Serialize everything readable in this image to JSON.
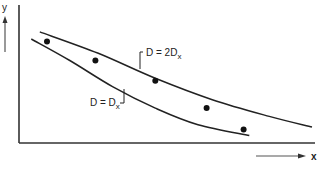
{
  "chart_data": {
    "type": "scatter",
    "title": "",
    "xlabel": "x",
    "ylabel": "y",
    "xlim": [
      0,
      10
    ],
    "ylim": [
      0,
      10
    ],
    "grid": false,
    "axes_arrows": true,
    "points": [
      {
        "x": 0.7,
        "y": 8.2
      },
      {
        "x": 2.4,
        "y": 6.6
      },
      {
        "x": 4.5,
        "y": 4.9
      },
      {
        "x": 6.3,
        "y": 2.6
      },
      {
        "x": 7.6,
        "y": 0.8
      }
    ],
    "series": [
      {
        "name": "D = 2Dx",
        "label_main": "D = 2D",
        "label_sub": "x",
        "x": [
          0.45,
          2.5,
          4.5,
          6.5,
          8.5,
          10.0
        ],
        "values": [
          9.0,
          7.2,
          5.1,
          3.3,
          1.9,
          1.0
        ]
      },
      {
        "name": "D = Dx",
        "label_main": "D = D",
        "label_sub": "x",
        "x": [
          0.15,
          1.5,
          3.0,
          4.5,
          6.0,
          7.8
        ],
        "values": [
          8.4,
          6.6,
          4.4,
          2.6,
          1.2,
          0.3
        ]
      }
    ]
  }
}
